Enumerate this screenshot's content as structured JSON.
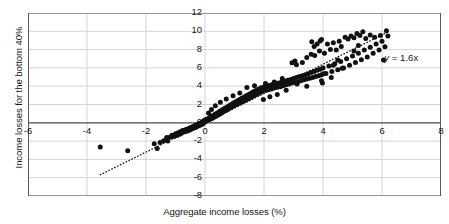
{
  "chart_data": {
    "type": "scatter",
    "title": "",
    "xlabel": "Aggregate income losses (%)",
    "ylabel": "Income losses for the bottom 40%",
    "xlim": [
      -6,
      8
    ],
    "ylim": [
      -8,
      12
    ],
    "xticks": [
      -6,
      -4,
      -2,
      0,
      2,
      4,
      6,
      8
    ],
    "xticklabels": [
      "-6",
      "-4",
      "-2",
      "0",
      "2",
      "4",
      "6",
      "8"
    ],
    "yticks": [
      -8,
      -6,
      -4,
      -2,
      0,
      2,
      4,
      6,
      8,
      10,
      12
    ],
    "yticklabels": [
      "-8",
      "-6",
      "-4",
      "-2",
      "0",
      "2",
      "4",
      "6",
      "8",
      "10",
      "12"
    ],
    "grid": true,
    "legend": null,
    "annotations": [
      {
        "text": "y = 1.6x",
        "text_italic_part": "y",
        "x": 6.35,
        "y": 7.0
      }
    ],
    "trendline": {
      "equation": "y = 1.6x",
      "slope": 1.6,
      "intercept": 0,
      "style": "dotted",
      "x_start": -3.55,
      "x_end": 6.25
    },
    "marker": {
      "shape": "circle",
      "color": "#111111",
      "size_px": 2.5
    },
    "series": [
      {
        "name": "Countries",
        "points": [
          [
            -3.55,
            -2.65
          ],
          [
            -2.62,
            -3.05
          ],
          [
            -1.62,
            -2.8
          ],
          [
            -1.72,
            -2.3
          ],
          [
            -1.52,
            -2.15
          ],
          [
            -1.4,
            -1.95
          ],
          [
            -1.3,
            -1.6
          ],
          [
            -1.26,
            -2.0
          ],
          [
            -1.18,
            -1.55
          ],
          [
            -1.12,
            -1.35
          ],
          [
            -1.05,
            -1.5
          ],
          [
            -1.0,
            -1.2
          ],
          [
            -0.95,
            -1.4
          ],
          [
            -0.9,
            -1.05
          ],
          [
            -0.86,
            -1.25
          ],
          [
            -0.82,
            -0.95
          ],
          [
            -0.8,
            -1.15
          ],
          [
            -0.76,
            -0.85
          ],
          [
            -0.72,
            -1.0
          ],
          [
            -0.68,
            -0.8
          ],
          [
            -0.65,
            -0.95
          ],
          [
            -0.62,
            -0.7
          ],
          [
            -0.58,
            -0.88
          ],
          [
            -0.55,
            -0.62
          ],
          [
            -0.52,
            -0.78
          ],
          [
            -0.5,
            -0.55
          ],
          [
            -0.47,
            -0.7
          ],
          [
            -0.44,
            -0.48
          ],
          [
            -0.42,
            -0.62
          ],
          [
            -0.4,
            -0.4
          ],
          [
            -0.38,
            -0.55
          ],
          [
            -0.36,
            -0.35
          ],
          [
            -0.34,
            -0.5
          ],
          [
            -0.32,
            -0.28
          ],
          [
            -0.3,
            -0.45
          ],
          [
            -0.28,
            -0.22
          ],
          [
            -0.26,
            -0.38
          ],
          [
            -0.24,
            -0.15
          ],
          [
            -0.22,
            -0.32
          ],
          [
            -0.2,
            -0.1
          ],
          [
            -0.18,
            -0.28
          ],
          [
            -0.16,
            -0.05
          ],
          [
            -0.15,
            -0.22
          ],
          [
            -0.13,
            0.0
          ],
          [
            -0.12,
            -0.18
          ],
          [
            -0.1,
            0.05
          ],
          [
            -0.09,
            -0.12
          ],
          [
            -0.08,
            0.1
          ],
          [
            -0.07,
            -0.08
          ],
          [
            -0.06,
            0.15
          ],
          [
            -0.05,
            -0.02
          ],
          [
            -0.04,
            0.2
          ],
          [
            -0.03,
            0.06
          ],
          [
            -0.02,
            0.25
          ],
          [
            -0.01,
            0.12
          ],
          [
            0.0,
            0.3
          ],
          [
            0.02,
            0.18
          ],
          [
            0.04,
            0.35
          ],
          [
            0.05,
            0.22
          ],
          [
            0.07,
            0.4
          ],
          [
            0.08,
            0.28
          ],
          [
            0.1,
            0.45
          ],
          [
            0.12,
            0.32
          ],
          [
            0.14,
            0.5
          ],
          [
            0.15,
            0.38
          ],
          [
            0.17,
            0.58
          ],
          [
            0.19,
            0.42
          ],
          [
            0.2,
            0.65
          ],
          [
            0.22,
            0.48
          ],
          [
            0.24,
            0.72
          ],
          [
            0.26,
            0.55
          ],
          [
            0.28,
            0.8
          ],
          [
            0.3,
            0.6
          ],
          [
            0.32,
            0.88
          ],
          [
            0.34,
            0.68
          ],
          [
            0.36,
            0.95
          ],
          [
            0.38,
            0.74
          ],
          [
            0.4,
            1.02
          ],
          [
            0.42,
            0.82
          ],
          [
            0.44,
            1.1
          ],
          [
            0.46,
            0.9
          ],
          [
            0.48,
            1.2
          ],
          [
            0.5,
            0.96
          ],
          [
            0.52,
            1.28
          ],
          [
            0.54,
            1.05
          ],
          [
            0.56,
            1.35
          ],
          [
            0.58,
            1.12
          ],
          [
            0.6,
            1.42
          ],
          [
            0.62,
            1.2
          ],
          [
            0.64,
            1.5
          ],
          [
            0.66,
            1.28
          ],
          [
            0.68,
            1.58
          ],
          [
            0.7,
            1.35
          ],
          [
            0.72,
            1.65
          ],
          [
            0.74,
            1.42
          ],
          [
            0.76,
            1.72
          ],
          [
            0.78,
            1.5
          ],
          [
            0.8,
            1.8
          ],
          [
            0.82,
            1.58
          ],
          [
            0.84,
            1.9
          ],
          [
            0.86,
            1.65
          ],
          [
            0.88,
            1.98
          ],
          [
            0.9,
            1.72
          ],
          [
            0.92,
            2.05
          ],
          [
            0.94,
            1.8
          ],
          [
            0.96,
            2.15
          ],
          [
            0.98,
            1.88
          ],
          [
            1.0,
            2.22
          ],
          [
            1.02,
            1.95
          ],
          [
            1.05,
            2.3
          ],
          [
            1.08,
            2.02
          ],
          [
            1.1,
            2.4
          ],
          [
            1.12,
            2.1
          ],
          [
            1.15,
            2.5
          ],
          [
            1.18,
            2.18
          ],
          [
            1.2,
            2.58
          ],
          [
            1.22,
            2.25
          ],
          [
            1.25,
            2.68
          ],
          [
            1.28,
            2.35
          ],
          [
            1.3,
            2.75
          ],
          [
            1.32,
            2.42
          ],
          [
            1.35,
            2.85
          ],
          [
            1.38,
            2.5
          ],
          [
            1.4,
            2.95
          ],
          [
            1.42,
            2.58
          ],
          [
            1.45,
            3.02
          ],
          [
            1.48,
            2.68
          ],
          [
            1.5,
            3.12
          ],
          [
            1.52,
            2.75
          ],
          [
            1.55,
            3.2
          ],
          [
            1.58,
            2.85
          ],
          [
            1.6,
            3.3
          ],
          [
            1.62,
            2.92
          ],
          [
            1.65,
            3.4
          ],
          [
            1.68,
            3.0
          ],
          [
            1.7,
            3.48
          ],
          [
            1.72,
            3.1
          ],
          [
            1.75,
            3.55
          ],
          [
            1.78,
            3.18
          ],
          [
            1.8,
            3.65
          ],
          [
            1.82,
            3.25
          ],
          [
            1.85,
            3.72
          ],
          [
            1.88,
            3.35
          ],
          [
            1.9,
            3.82
          ],
          [
            1.95,
            3.45
          ],
          [
            2.0,
            3.9
          ],
          [
            2.05,
            3.55
          ],
          [
            2.1,
            4.0
          ],
          [
            2.15,
            3.62
          ],
          [
            2.2,
            4.1
          ],
          [
            2.25,
            3.7
          ],
          [
            2.3,
            4.2
          ],
          [
            2.35,
            3.8
          ],
          [
            2.4,
            4.28
          ],
          [
            2.45,
            3.88
          ],
          [
            2.5,
            4.35
          ],
          [
            2.55,
            3.95
          ],
          [
            2.6,
            4.45
          ],
          [
            2.65,
            4.05
          ],
          [
            2.7,
            4.55
          ],
          [
            2.75,
            4.15
          ],
          [
            2.8,
            4.65
          ],
          [
            2.85,
            4.25
          ],
          [
            2.9,
            4.72
          ],
          [
            2.95,
            4.35
          ],
          [
            3.0,
            4.85
          ],
          [
            3.05,
            4.42
          ],
          [
            3.1,
            4.95
          ],
          [
            3.15,
            4.5
          ],
          [
            3.2,
            5.05
          ],
          [
            3.25,
            4.6
          ],
          [
            3.3,
            5.15
          ],
          [
            3.35,
            4.7
          ],
          [
            3.4,
            5.25
          ],
          [
            3.45,
            4.78
          ],
          [
            3.5,
            5.35
          ],
          [
            3.55,
            4.88
          ],
          [
            3.6,
            5.5
          ],
          [
            3.65,
            4.95
          ],
          [
            3.7,
            5.6
          ],
          [
            3.75,
            5.05
          ],
          [
            3.8,
            5.75
          ],
          [
            3.85,
            5.15
          ],
          [
            3.9,
            5.85
          ],
          [
            3.95,
            5.25
          ],
          [
            4.0,
            6.0
          ],
          [
            4.1,
            5.4
          ],
          [
            4.2,
            6.2
          ],
          [
            4.3,
            5.6
          ],
          [
            4.4,
            6.45
          ],
          [
            4.5,
            5.8
          ],
          [
            4.6,
            6.7
          ],
          [
            4.7,
            6.0
          ],
          [
            4.8,
            7.0
          ],
          [
            4.9,
            6.3
          ],
          [
            5.0,
            7.3
          ],
          [
            5.1,
            6.6
          ],
          [
            5.2,
            7.6
          ],
          [
            5.3,
            6.9
          ],
          [
            5.4,
            7.95
          ],
          [
            5.5,
            7.2
          ],
          [
            5.6,
            8.25
          ],
          [
            5.7,
            7.6
          ],
          [
            5.8,
            8.6
          ],
          [
            5.9,
            7.95
          ],
          [
            6.0,
            8.9
          ],
          [
            6.1,
            8.3
          ],
          [
            6.2,
            9.5
          ],
          [
            2.95,
            6.55
          ],
          [
            3.05,
            6.75
          ],
          [
            3.1,
            6.35
          ],
          [
            3.3,
            6.6
          ],
          [
            3.45,
            7.15
          ],
          [
            3.6,
            7.5
          ],
          [
            3.7,
            8.35
          ],
          [
            3.8,
            8.6
          ],
          [
            3.9,
            8.95
          ],
          [
            3.95,
            9.1
          ],
          [
            3.62,
            8.85
          ],
          [
            3.72,
            7.35
          ],
          [
            3.88,
            7.85
          ],
          [
            4.05,
            7.6
          ],
          [
            4.15,
            8.6
          ],
          [
            4.25,
            8.0
          ],
          [
            4.35,
            8.75
          ],
          [
            4.45,
            7.95
          ],
          [
            4.55,
            8.9
          ],
          [
            4.62,
            8.35
          ],
          [
            4.75,
            9.35
          ],
          [
            4.85,
            9.15
          ],
          [
            4.95,
            9.5
          ],
          [
            5.05,
            9.3
          ],
          [
            5.15,
            9.75
          ],
          [
            5.25,
            9.55
          ],
          [
            5.35,
            9.95
          ],
          [
            5.45,
            9.2
          ],
          [
            5.6,
            9.6
          ],
          [
            5.75,
            9.35
          ],
          [
            5.95,
            9.55
          ],
          [
            6.15,
            10.05
          ],
          [
            5.05,
            7.85
          ],
          [
            5.2,
            8.45
          ],
          [
            4.5,
            6.85
          ],
          [
            4.35,
            6.3
          ],
          [
            4.02,
            5.35
          ],
          [
            3.95,
            4.6
          ],
          [
            3.45,
            4.0
          ],
          [
            3.12,
            4.25
          ],
          [
            2.75,
            3.55
          ],
          [
            2.45,
            3.1
          ],
          [
            2.2,
            2.85
          ],
          [
            1.98,
            2.55
          ],
          [
            6.05,
            6.85
          ],
          [
            4.65,
            5.95
          ],
          [
            4.28,
            4.95
          ],
          [
            3.98,
            4.35
          ],
          [
            2.62,
            4.85
          ],
          [
            2.35,
            4.45
          ],
          [
            2.05,
            4.3
          ],
          [
            1.68,
            4.05
          ],
          [
            1.42,
            3.85
          ],
          [
            1.18,
            3.25
          ],
          [
            0.95,
            2.95
          ],
          [
            0.72,
            2.6
          ],
          [
            0.52,
            2.25
          ],
          [
            0.35,
            1.85
          ],
          [
            0.22,
            1.45
          ],
          [
            0.12,
            1.08
          ]
        ]
      }
    ]
  }
}
